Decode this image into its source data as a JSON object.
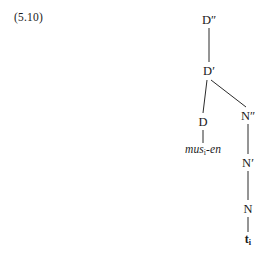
{
  "figure": {
    "example_number": "(5.10)",
    "background_color": "#ffffff",
    "ink_color": "#1a1a1a",
    "edge_color": "#2b2b2b"
  },
  "tree": {
    "type": "syntax-tree",
    "nodes": [
      {
        "id": "Dmax",
        "label_base": "D",
        "label_prime": "″",
        "label": "D″",
        "x": 209,
        "y": 20,
        "kind": "phrasal"
      },
      {
        "id": "Dbar",
        "label_base": "D",
        "label_prime": "′",
        "label": "D′",
        "x": 209,
        "y": 71,
        "kind": "intermediate"
      },
      {
        "id": "Dhead",
        "label_base": "D",
        "label_prime": "",
        "label": "D",
        "x": 203,
        "y": 122,
        "kind": "head"
      },
      {
        "id": "Nmax",
        "label_base": "N",
        "label_prime": "″",
        "label": "N″",
        "x": 248,
        "y": 116,
        "kind": "phrasal"
      },
      {
        "id": "Nbar",
        "label_base": "N",
        "label_prime": "′",
        "label": "N′",
        "x": 248,
        "y": 163,
        "kind": "intermediate"
      },
      {
        "id": "Nhead",
        "label_base": "N",
        "label_prime": "",
        "label": "N",
        "x": 248,
        "y": 209,
        "kind": "head"
      }
    ],
    "terminals": [
      {
        "id": "musen",
        "text": "mus",
        "subscript": "i",
        "text_after": "-en",
        "full": "musᵢ-en",
        "x": 203,
        "y": 150,
        "style": "italic"
      },
      {
        "id": "trace",
        "text": "t",
        "subscript": "i",
        "text_after": "",
        "full": "tᵢ",
        "x": 248,
        "y": 240,
        "style": "bold"
      }
    ],
    "edges": [
      {
        "from": "Dmax",
        "to": "Dbar",
        "x1": 209,
        "y1": 28,
        "x2": 209,
        "y2": 62
      },
      {
        "from": "Dbar",
        "to": "Dhead",
        "x1": 207,
        "y1": 80,
        "x2": 203,
        "y2": 113
      },
      {
        "from": "Dbar",
        "to": "Nmax",
        "x1": 211,
        "y1": 80,
        "x2": 246,
        "y2": 107
      },
      {
        "from": "Dhead",
        "to": "musen",
        "x1": 203,
        "y1": 130,
        "x2": 203,
        "y2": 143
      },
      {
        "from": "Nmax",
        "to": "Nbar",
        "x1": 248,
        "y1": 124,
        "x2": 248,
        "y2": 154
      },
      {
        "from": "Nbar",
        "to": "Nhead",
        "x1": 248,
        "y1": 171,
        "x2": 248,
        "y2": 200
      },
      {
        "from": "Nhead",
        "to": "trace",
        "x1": 248,
        "y1": 217,
        "x2": 248,
        "y2": 232
      }
    ]
  }
}
